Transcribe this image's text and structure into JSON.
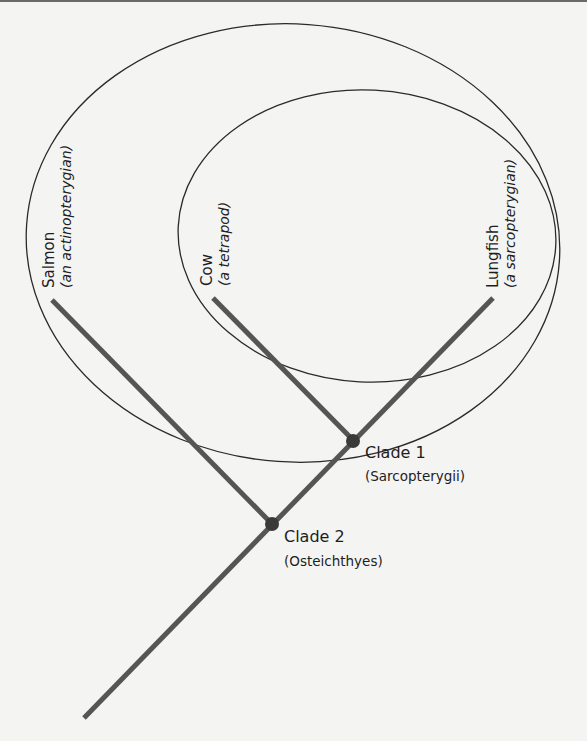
{
  "colors": {
    "background": "#f4f4f3",
    "branch": "#555555",
    "ellipse": "#2a2a2a",
    "node": "#3a3a3a",
    "text": "#1e1e1e"
  },
  "taxa": [
    {
      "name": "Salmon",
      "description": "(an actinopterygian)"
    },
    {
      "name": "Cow",
      "description": "(a tetrapod)"
    },
    {
      "name": "Lungfish",
      "description": "(a sarcopterygian)"
    }
  ],
  "clades": [
    {
      "label": "Clade 1",
      "group": "(Sarcopterygii)"
    },
    {
      "label": "Clade 2",
      "group": "(Osteichthyes)"
    }
  ]
}
